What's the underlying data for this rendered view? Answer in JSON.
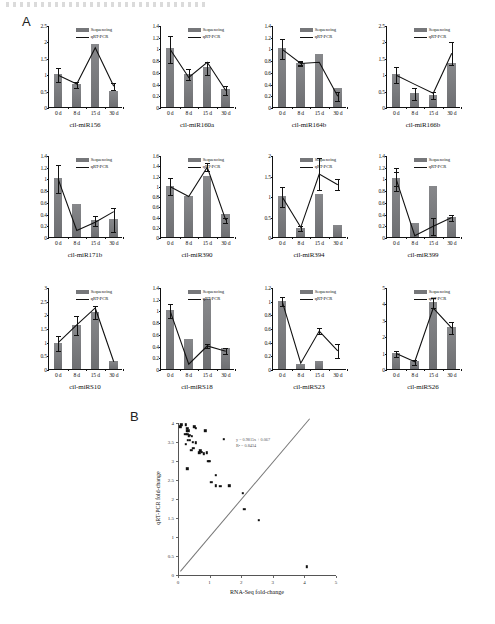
{
  "figure": {
    "panel_a_letter": "A",
    "panel_b_letter": "B",
    "legend": {
      "series1": "Sequencing",
      "series2": "qRT-PCR"
    }
  },
  "chart_data": [
    {
      "type": "bar",
      "title": "cil-miR156",
      "categories": [
        "0 d",
        "8 d",
        "15 d",
        "30 d"
      ],
      "xlabel": "",
      "ylabel": "",
      "ylim": [
        0,
        2.5
      ],
      "yticks": [
        0,
        0.5,
        1,
        1.5,
        2,
        2.5
      ],
      "ytick_labels": [
        "0",
        "0.5",
        "1",
        "1.5",
        "2",
        "2.5"
      ],
      "series": [
        {
          "name": "Sequencing",
          "type": "bar",
          "values": [
            1.0,
            0.7,
            1.93,
            0.49
          ],
          "errors": [
            0.22,
            0.1,
            0.0,
            0.0
          ]
        },
        {
          "name": "qRT-PCR",
          "type": "line",
          "values": [
            1.0,
            0.73,
            1.84,
            0.66
          ],
          "errors": [
            0.0,
            0.0,
            0.0,
            0.1
          ]
        }
      ]
    },
    {
      "type": "bar",
      "title": "cil-miR160a",
      "categories": [
        "0 d",
        "8 d",
        "15 d",
        "30 d"
      ],
      "xlabel": "",
      "ylabel": "",
      "ylim": [
        0,
        1.4
      ],
      "yticks": [
        0,
        0.2,
        0.4,
        0.6,
        0.8,
        1,
        1.2,
        1.4
      ],
      "ytick_labels": [
        "0",
        "0.2",
        "0.4",
        "0.6",
        "0.8",
        "1",
        "1.2",
        "1.4"
      ],
      "series": [
        {
          "name": "Sequencing",
          "type": "bar",
          "values": [
            1.0,
            0.57,
            0.68,
            0.3
          ],
          "errors": [
            0.23,
            0.1,
            0.11,
            0.07
          ]
        },
        {
          "name": "qRT-PCR",
          "type": "line",
          "values": [
            1.0,
            0.52,
            0.78,
            0.3
          ],
          "errors": [
            0.0,
            0.0,
            0.0,
            0.0
          ]
        }
      ]
    },
    {
      "type": "bar",
      "title": "cil-miR164b",
      "categories": [
        "0 d",
        "8 d",
        "15 d",
        "30 d"
      ],
      "xlabel": "",
      "ylabel": "",
      "ylim": [
        0,
        1.4
      ],
      "yticks": [
        0,
        0.2,
        0.4,
        0.6,
        0.8,
        1,
        1.2,
        1.4
      ],
      "ytick_labels": [
        "0",
        "0.2",
        "0.4",
        "0.6",
        "0.8",
        "1",
        "1.2",
        "1.4"
      ],
      "series": [
        {
          "name": "Sequencing",
          "type": "bar",
          "values": [
            1.0,
            0.76,
            0.91,
            0.33
          ],
          "errors": [
            0.17,
            0.04,
            0.0,
            0.0
          ]
        },
        {
          "name": "qRT-PCR",
          "type": "line",
          "values": [
            1.0,
            0.76,
            0.78,
            0.2
          ],
          "errors": [
            0.0,
            0.03,
            0.0,
            0.08
          ]
        }
      ]
    },
    {
      "type": "bar",
      "title": "cil-miR166b",
      "categories": [
        "0 d",
        "8 d",
        "15 d",
        "30 d"
      ],
      "xlabel": "",
      "ylabel": "",
      "ylim": [
        0,
        2.5
      ],
      "yticks": [
        0,
        0.5,
        1,
        1.5,
        2,
        2.5
      ],
      "ytick_labels": [
        "0",
        "0.5",
        "1",
        "1.5",
        "2",
        "2.5"
      ],
      "series": [
        {
          "name": "Sequencing",
          "type": "bar",
          "values": [
            1.0,
            0.42,
            0.38,
            1.34
          ],
          "errors": [
            0.25,
            0.18,
            0.12,
            0.0
          ]
        },
        {
          "name": "qRT-PCR",
          "type": "line",
          "values": [
            1.0,
            0.72,
            0.45,
            1.67
          ],
          "errors": [
            0.0,
            0.0,
            0.0,
            0.35
          ]
        }
      ]
    },
    {
      "type": "bar",
      "title": "cil-miR171b",
      "categories": [
        "0 d",
        "8 d",
        "15 d",
        "30 d"
      ],
      "xlabel": "",
      "ylabel": "",
      "ylim": [
        0,
        1.4
      ],
      "yticks": [
        0,
        0.2,
        0.4,
        0.6,
        0.8,
        1,
        1.2,
        1.4
      ],
      "ytick_labels": [
        "0",
        "0.2",
        "0.4",
        "0.6",
        "0.8",
        "1",
        "1.2",
        "1.4"
      ],
      "series": [
        {
          "name": "Sequencing",
          "type": "bar",
          "values": [
            1.0,
            0.56,
            0.29,
            0.31
          ],
          "errors": [
            0.24,
            0.0,
            0.09,
            0.2
          ]
        },
        {
          "name": "qRT-PCR",
          "type": "line",
          "values": [
            1.0,
            0.13,
            0.27,
            0.45
          ],
          "errors": [
            0.0,
            0.0,
            0.0,
            0.0
          ]
        }
      ]
    },
    {
      "type": "bar",
      "title": "cil-miR390",
      "categories": [
        "0 d",
        "8 d",
        "15 d",
        "30 d"
      ],
      "xlabel": "",
      "ylabel": "",
      "ylim": [
        0,
        1.6
      ],
      "yticks": [
        0,
        0.2,
        0.4,
        0.6,
        0.8,
        1,
        1.2,
        1.4,
        1.6
      ],
      "ytick_labels": [
        "0",
        "0.2",
        "0.4",
        "0.6",
        "0.8",
        "1",
        "1.2",
        "1.4",
        "1.6"
      ],
      "series": [
        {
          "name": "Sequencing",
          "type": "bar",
          "values": [
            1.0,
            0.81,
            1.2,
            0.44
          ],
          "errors": [
            0.17,
            0.0,
            0.0,
            0.0
          ]
        },
        {
          "name": "qRT-PCR",
          "type": "line",
          "values": [
            1.0,
            0.81,
            1.38,
            0.35
          ],
          "errors": [
            0.0,
            0.0,
            0.08,
            0.05
          ]
        }
      ]
    },
    {
      "type": "bar",
      "title": "cil-miR394",
      "categories": [
        "0 d",
        "8 d",
        "15 d",
        "30 d"
      ],
      "xlabel": "",
      "ylabel": "",
      "ylim": [
        0,
        2
      ],
      "yticks": [
        0,
        0.5,
        1,
        1.5,
        2
      ],
      "ytick_labels": [
        "0",
        "0.5",
        "1",
        "1.5",
        "2"
      ],
      "series": [
        {
          "name": "Sequencing",
          "type": "bar",
          "values": [
            1.0,
            0.23,
            1.05,
            0.3
          ],
          "errors": [
            0.24,
            0.06,
            0.0,
            0.0
          ]
        },
        {
          "name": "qRT-PCR",
          "type": "line",
          "values": [
            1.0,
            0.26,
            1.56,
            1.3
          ],
          "errors": [
            0.0,
            0.0,
            0.38,
            0.13
          ]
        }
      ]
    },
    {
      "type": "bar",
      "title": "cil-miR399",
      "categories": [
        "0 d",
        "8 d",
        "15 d",
        "30 d"
      ],
      "xlabel": "",
      "ylabel": "",
      "ylim": [
        0,
        1.4
      ],
      "yticks": [
        0,
        0.2,
        0.4,
        0.6,
        0.8,
        1,
        1.2,
        1.4
      ],
      "ytick_labels": [
        "0",
        "0.2",
        "0.4",
        "0.6",
        "0.8",
        "1",
        "1.2",
        "1.4"
      ],
      "series": [
        {
          "name": "Sequencing",
          "type": "bar",
          "values": [
            1.0,
            0.24,
            0.87,
            0.34
          ],
          "errors": [
            0.2,
            0.0,
            0.0,
            0.05
          ]
        },
        {
          "name": "qRT-PCR",
          "type": "line",
          "values": [
            1.0,
            0.04,
            0.2,
            0.35
          ],
          "errors": [
            0.12,
            0.0,
            0.15,
            0.0
          ]
        }
      ]
    },
    {
      "type": "bar",
      "title": "cil-miRS10",
      "categories": [
        "0 d",
        "8 d",
        "15 d",
        "30 d"
      ],
      "xlabel": "",
      "ylabel": "",
      "ylim": [
        0,
        3
      ],
      "yticks": [
        0,
        0.5,
        1,
        1.5,
        2,
        2.5,
        3
      ],
      "ytick_labels": [
        "0",
        "0.5",
        "1",
        "1.5",
        "2",
        "2.5",
        "3"
      ],
      "series": [
        {
          "name": "Sequencing",
          "type": "bar",
          "values": [
            0.97,
            1.62,
            2.1,
            0.29
          ],
          "errors": [
            0.27,
            0.35,
            0.25,
            0.0
          ]
        },
        {
          "name": "qRT-PCR",
          "type": "line",
          "values": [
            1.0,
            1.65,
            2.27,
            0.3
          ],
          "errors": [
            0.0,
            0.0,
            0.0,
            0.0
          ]
        }
      ]
    },
    {
      "type": "bar",
      "title": "cil-miRS18",
      "categories": [
        "0 d",
        "8 d",
        "15 d",
        "30 d"
      ],
      "xlabel": "",
      "ylabel": "",
      "ylim": [
        0,
        1.4
      ],
      "yticks": [
        0,
        0.2,
        0.4,
        0.6,
        0.8,
        1,
        1.2,
        1.4
      ],
      "ytick_labels": [
        "0",
        "0.2",
        "0.4",
        "0.6",
        "0.8",
        "1",
        "1.2",
        "1.4"
      ],
      "series": [
        {
          "name": "Sequencing",
          "type": "bar",
          "values": [
            1.0,
            0.51,
            1.2,
            0.36
          ],
          "errors": [
            0.12,
            0.0,
            0.0,
            0.0
          ]
        },
        {
          "name": "qRT-PCR",
          "type": "line",
          "values": [
            1.0,
            0.1,
            0.41,
            0.32
          ],
          "errors": [
            0.0,
            0.0,
            0.04,
            0.05
          ]
        }
      ]
    },
    {
      "type": "bar",
      "title": "cil-miRS23",
      "categories": [
        "0 d",
        "8 d",
        "15 d",
        "30 d"
      ],
      "xlabel": "",
      "ylabel": "",
      "ylim": [
        0,
        1.2
      ],
      "yticks": [
        0,
        0.2,
        0.4,
        0.6,
        0.8,
        1,
        1.2
      ],
      "ytick_labels": [
        "0",
        "0.2",
        "0.4",
        "0.6",
        "0.8",
        "1",
        "1.2"
      ],
      "series": [
        {
          "name": "Sequencing",
          "type": "bar",
          "values": [
            1.0,
            0.07,
            0.11,
            0.0
          ],
          "errors": [
            0.07,
            0.0,
            0.0,
            0.0
          ]
        },
        {
          "name": "qRT-PCR",
          "type": "line",
          "values": [
            1.0,
            0.1,
            0.57,
            0.28
          ],
          "errors": [
            0.0,
            0.0,
            0.04,
            0.1
          ]
        }
      ]
    },
    {
      "type": "bar",
      "title": "cil-miRS26",
      "categories": [
        "0 d",
        "8 d",
        "15 d",
        "30 d"
      ],
      "xlabel": "",
      "ylabel": "",
      "ylim": [
        0,
        5
      ],
      "yticks": [
        0,
        1,
        2,
        3,
        4,
        5
      ],
      "ytick_labels": [
        "0",
        "1",
        "2",
        "3",
        "4",
        "5"
      ],
      "series": [
        {
          "name": "Sequencing",
          "type": "bar",
          "values": [
            0.95,
            0.47,
            4.08,
            2.55
          ],
          "errors": [
            0.18,
            0.14,
            0.3,
            0.38
          ]
        },
        {
          "name": "qRT-PCR",
          "type": "line",
          "values": [
            1.0,
            0.5,
            3.78,
            2.55
          ],
          "errors": [
            0.0,
            0.0,
            0.0,
            0.0
          ]
        }
      ]
    },
    {
      "type": "scatter",
      "title": "",
      "xlabel": "RNA-Seq fold-change",
      "ylabel": "qRT-PCR fold-change",
      "xlim": [
        0,
        5
      ],
      "ylim": [
        0,
        4
      ],
      "xticks": [
        0,
        1,
        2,
        3,
        4,
        5
      ],
      "xtick_labels": [
        "0",
        "1",
        "2",
        "3",
        "4",
        "5"
      ],
      "yticks": [
        0,
        0.5,
        1,
        1.5,
        2,
        2.5,
        3,
        3.5,
        4
      ],
      "ytick_labels": [
        "0",
        "0.5",
        "1",
        "1.5",
        "2",
        "2.5",
        "3",
        "3.5",
        "4"
      ],
      "equation": "y = 0.9815x + 0.067",
      "r_squared": "R² = 0.8434",
      "trend_slope": 0.9815,
      "trend_intercept": 0.067,
      "points": [
        [
          0.07,
          0.1
        ],
        [
          0.1,
          0.04
        ],
        [
          0.23,
          0.3
        ],
        [
          0.24,
          0.04
        ],
        [
          0.24,
          0.55
        ],
        [
          0.27,
          0.2
        ],
        [
          0.29,
          0.3
        ],
        [
          0.3,
          0.13
        ],
        [
          0.3,
          1.2
        ],
        [
          0.31,
          0.45
        ],
        [
          0.33,
          0.2
        ],
        [
          0.34,
          0.35
        ],
        [
          0.36,
          0.32
        ],
        [
          0.38,
          0.45
        ],
        [
          0.42,
          0.72
        ],
        [
          0.44,
          0.35
        ],
        [
          0.47,
          0.5
        ],
        [
          0.49,
          0.66
        ],
        [
          0.51,
          0.1
        ],
        [
          0.56,
          0.13
        ],
        [
          0.57,
          0.52
        ],
        [
          0.68,
          0.78
        ],
        [
          0.7,
          0.73
        ],
        [
          0.76,
          0.76
        ],
        [
          0.81,
          0.81
        ],
        [
          0.87,
          0.2
        ],
        [
          0.91,
          0.78
        ],
        [
          0.95,
          1.0
        ],
        [
          0.97,
          1.0
        ],
        [
          1.0,
          1.0
        ],
        [
          1.05,
          1.56
        ],
        [
          1.2,
          1.38
        ],
        [
          1.2,
          1.65
        ],
        [
          1.34,
          1.67
        ],
        [
          1.45,
          0.43
        ],
        [
          1.62,
          1.65
        ],
        [
          2.1,
          2.27
        ],
        [
          2.05,
          1.85
        ],
        [
          2.55,
          2.55
        ],
        [
          4.08,
          3.78
        ]
      ]
    }
  ]
}
